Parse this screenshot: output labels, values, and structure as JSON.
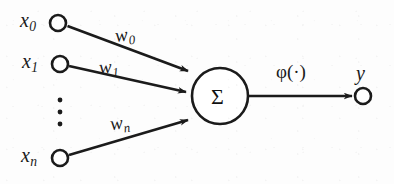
{
  "diagram": {
    "ink_color": "#1b1b1b",
    "background_color": "#fdfdfd",
    "inputs": [
      {
        "id": "x0",
        "base": "x",
        "sub": "0",
        "label": "x0",
        "node_cx": 58,
        "node_cy": 23,
        "node_r": 8
      },
      {
        "id": "x1",
        "base": "x",
        "sub": "1",
        "label": "x1",
        "node_cx": 60,
        "node_cy": 64,
        "node_r": 8
      },
      {
        "id": "xn",
        "base": "x",
        "sub": "n",
        "label": "xn",
        "node_cx": 60,
        "node_cy": 158,
        "node_r": 8
      }
    ],
    "vertical_ellipsis": {
      "dots": 3,
      "x": 60,
      "y_values": [
        100,
        112,
        124
      ]
    },
    "weights": [
      {
        "id": "w0",
        "base": "w",
        "sub": "0",
        "label": "w0"
      },
      {
        "id": "w1",
        "base": "w",
        "sub": "1",
        "label": "w1"
      },
      {
        "id": "wn",
        "base": "w",
        "sub": "n",
        "label": "wn"
      }
    ],
    "summation_node": {
      "symbol": "Σ",
      "cx": 220,
      "cy": 96,
      "r": 28
    },
    "activation": {
      "label": "φ(·)"
    },
    "output": {
      "base": "y",
      "sub": "",
      "label": "y",
      "node_cx": 363,
      "node_cy": 96,
      "node_r": 8
    }
  }
}
